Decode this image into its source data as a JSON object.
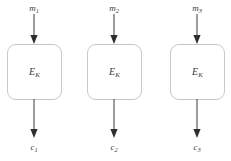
{
  "diagram": {
    "background_color": "#ffffff",
    "stroke_color": "#3a3a3a",
    "box_border_color": "#c8c8c8",
    "text_color": "#3a3a3a",
    "blocks": [
      {
        "input_base": "m",
        "input_sub": "1",
        "cipher_base": "E",
        "cipher_sub": "K",
        "output_base": "c",
        "output_sub": "1",
        "left": 7,
        "width": 55,
        "center": 34
      },
      {
        "input_base": "m",
        "input_sub": "2",
        "cipher_base": "E",
        "cipher_sub": "K",
        "output_base": "c",
        "output_sub": "2",
        "left": 87,
        "width": 55,
        "center": 114
      },
      {
        "input_base": "m",
        "input_sub": "3",
        "cipher_base": "E",
        "cipher_sub": "K",
        "output_base": "c",
        "output_sub": "3",
        "left": 170,
        "width": 55,
        "center": 197
      }
    ]
  }
}
